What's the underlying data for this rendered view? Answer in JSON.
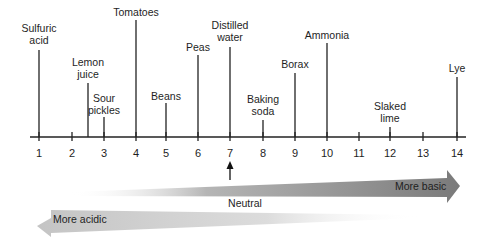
{
  "figure": {
    "axis": {
      "ticks": [
        "1",
        "2",
        "3",
        "4",
        "5",
        "6",
        "7",
        "8",
        "9",
        "10",
        "11",
        "12",
        "13",
        "14"
      ],
      "tick_x": [
        39,
        72,
        104,
        136,
        166,
        198,
        230,
        263,
        295,
        327,
        359,
        390,
        423,
        457
      ],
      "y": 137,
      "x_start": 30,
      "x_end": 466
    },
    "substances": [
      {
        "name": "Sulfuric\nacid",
        "ph": 1,
        "x": 39,
        "top": 50,
        "label_y": 22
      },
      {
        "name": "Lemon\njuice",
        "ph": 2.5,
        "x": 88,
        "top": 83,
        "label_y": 56
      },
      {
        "name": "Sour\npickles",
        "ph": 3,
        "x": 104,
        "top": 117,
        "label_y": 92
      },
      {
        "name": "Tomatoes",
        "ph": 4,
        "x": 136,
        "top": 20,
        "label_y": 6
      },
      {
        "name": "Beans",
        "ph": 5,
        "x": 166,
        "top": 103,
        "label_y": 90
      },
      {
        "name": "Peas",
        "ph": 6,
        "x": 198,
        "top": 55,
        "label_y": 41
      },
      {
        "name": "Distilled\nwater",
        "ph": 7,
        "x": 230,
        "top": 47,
        "label_y": 19
      },
      {
        "name": "Baking\nsoda",
        "ph": 8,
        "x": 263,
        "top": 120,
        "label_y": 93
      },
      {
        "name": "Borax",
        "ph": 9,
        "x": 295,
        "top": 73,
        "label_y": 58
      },
      {
        "name": "Ammonia",
        "ph": 10,
        "x": 327,
        "top": 43,
        "label_y": 29
      },
      {
        "name": "Slaked\nlime",
        "ph": 12,
        "x": 390,
        "top": 127,
        "label_y": 100
      },
      {
        "name": "Lye",
        "ph": 14,
        "x": 457,
        "top": 77,
        "label_y": 62
      }
    ],
    "neutral_marker": {
      "label": "Neutral",
      "ph": 7
    },
    "arrows": {
      "basic": {
        "label": "More basic",
        "color": "#7f7f7f"
      },
      "acidic": {
        "label": "More acidic",
        "color": "#c9c9c9"
      }
    }
  }
}
